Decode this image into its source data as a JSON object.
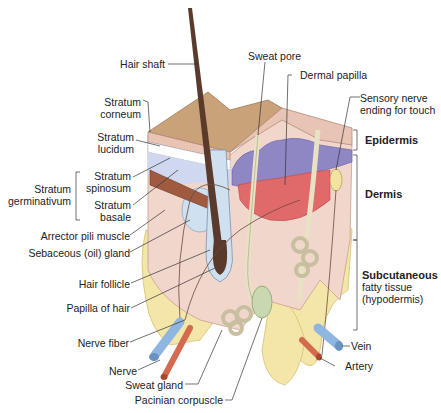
{
  "diagram": {
    "labels_left": {
      "hair_shaft": "Hair shaft",
      "stratum_corneum_1": "Stratum",
      "stratum_corneum_2": "corneum",
      "stratum_lucidum_1": "Stratum",
      "stratum_lucidum_2": "lucidum",
      "stratum_germinativum_1": "Stratum",
      "stratum_germinativum_2": "germinativum",
      "stratum_spinosum_1": "Stratum",
      "stratum_spinosum_2": "spinosum",
      "stratum_basale_1": "Stratum",
      "stratum_basale_2": "basale",
      "arrector_pili": "Arrector pili muscle",
      "sebaceous": "Sebaceous (oil) gland",
      "hair_follicle": "Hair follicle",
      "papilla_hair": "Papilla of hair",
      "nerve_fiber": "Nerve fiber",
      "nerve": "Nerve",
      "sweat_gland": "Sweat gland",
      "pacinian": "Pacinian corpuscle"
    },
    "labels_top": {
      "sweat_pore": "Sweat pore",
      "dermal_papilla": "Dermal papilla",
      "sensory_1": "Sensory nerve",
      "sensory_2": "ending for touch"
    },
    "labels_right": {
      "epidermis": "Epidermis",
      "dermis": "Dermis",
      "subcutaneous_1": "Subcutaneous",
      "subcutaneous_2": "fatty tissue",
      "subcutaneous_3": "(hypodermis)",
      "vein": "Vein",
      "artery": "Artery"
    },
    "colors": {
      "surface": "#c9a27a",
      "epidermis": "#e8c4b4",
      "basal_blue": "#8f86c4",
      "dermis_red": "#e06a6a",
      "dermis": "#f1d6cc",
      "fat": "#f3e6a8",
      "hair": "#5a3a2a",
      "vein": "#8fb6e0",
      "artery": "#d46a4e",
      "gland": "#e8e2c4"
    }
  }
}
